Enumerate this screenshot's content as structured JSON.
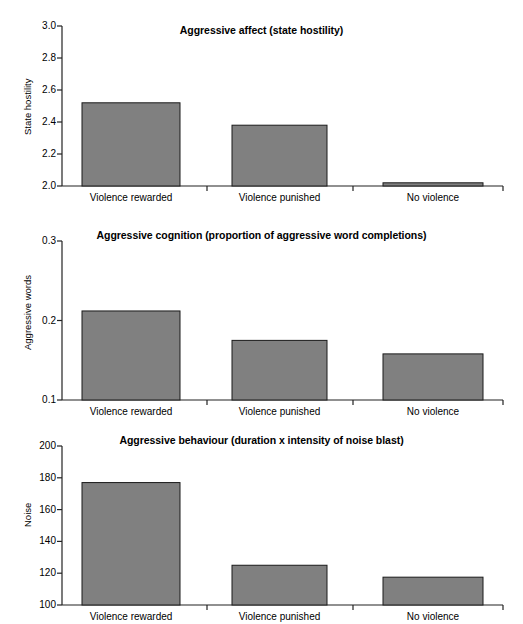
{
  "figure": {
    "background_color": "#ffffff",
    "bar_fill_color": "#808080",
    "bar_edge_color": "#1a1a1a",
    "axis_color": "#222222"
  },
  "chart_data": [
    {
      "type": "bar",
      "title": "Aggressive affect (state hostility)",
      "xlabel": "",
      "ylabel": "State hostility",
      "categories": [
        "Violence rewarded",
        "Violence punished",
        "No violence"
      ],
      "values": [
        2.52,
        2.38,
        2.02
      ],
      "ylim": [
        2.0,
        3.0
      ],
      "yticks": [
        "2.0",
        "2.2",
        "2.4",
        "2.6",
        "2.8",
        "3.0"
      ],
      "ytick_values": [
        2.0,
        2.2,
        2.4,
        2.6,
        2.8,
        3.0
      ],
      "grid": false,
      "legend": "none"
    },
    {
      "type": "bar",
      "title": "Aggressive cognition (proportion of aggressive word completions)",
      "xlabel": "",
      "ylabel": "Aggressive words",
      "categories": [
        "Violence rewarded",
        "Violence punished",
        "No violence"
      ],
      "values": [
        0.212,
        0.175,
        0.158
      ],
      "ylim": [
        0.1,
        0.3
      ],
      "yticks": [
        "0.1",
        "0.2",
        "0.3"
      ],
      "ytick_values": [
        0.1,
        0.2,
        0.3
      ],
      "grid": false,
      "legend": "none"
    },
    {
      "type": "bar",
      "title": "Aggressive behaviour (duration x intensity of noise blast)",
      "xlabel": "",
      "ylabel": "Noise",
      "categories": [
        "Violence rewarded",
        "Violence punished",
        "No violence"
      ],
      "values": [
        177,
        125,
        117.5
      ],
      "ylim": [
        100,
        200
      ],
      "yticks": [
        "100",
        "120",
        "140",
        "160",
        "180",
        "200"
      ],
      "ytick_values": [
        100,
        120,
        140,
        160,
        180,
        200
      ],
      "grid": false,
      "legend": "none"
    }
  ]
}
